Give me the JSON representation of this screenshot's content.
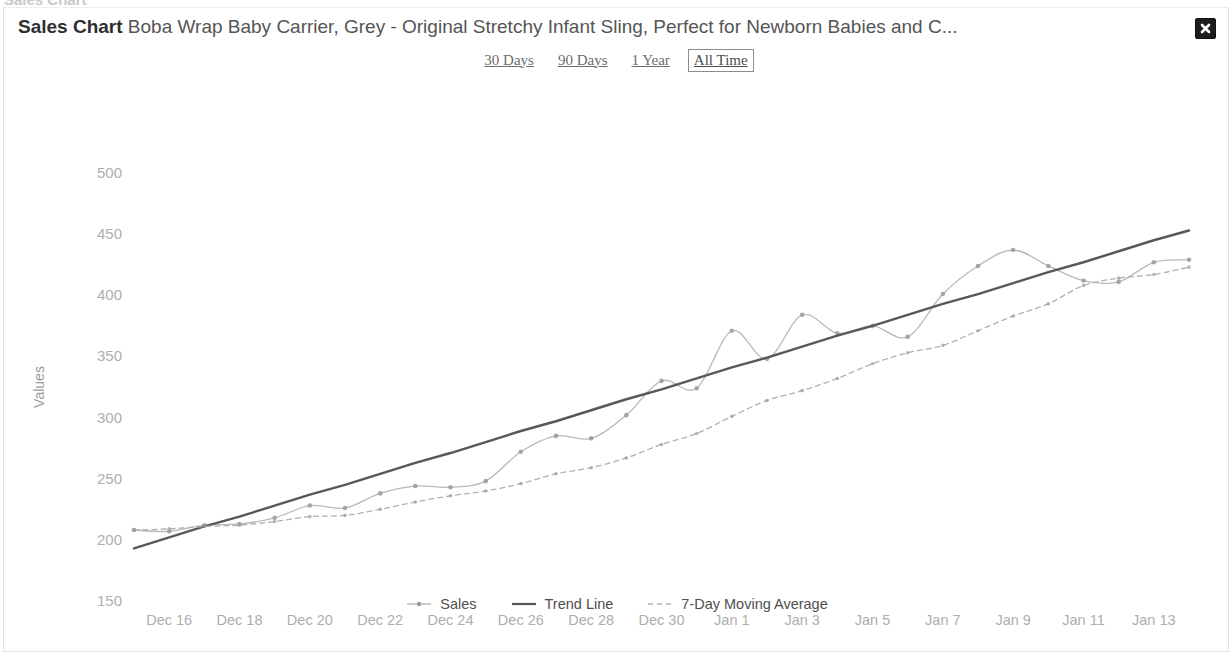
{
  "background_text": "Sales Chart",
  "header": {
    "title_strong": "Sales Chart",
    "title_rest": " Boba Wrap Baby Carrier, Grey - Original Stretchy Infant Sling, Perfect for Newborn Babies and C...",
    "close_label": "×"
  },
  "tabs": [
    {
      "label": "30 Days",
      "selected": false
    },
    {
      "label": "90 Days",
      "selected": false
    },
    {
      "label": "1 Year",
      "selected": false
    },
    {
      "label": "All Time",
      "selected": true
    }
  ],
  "colors": {
    "sales_line": "#b9b9b9",
    "sales_marker": "#9a9a9a",
    "trend_line": "#585858",
    "moving_average": "#b0b0b0",
    "axis_text": "#aeaeae",
    "axis_title": "#9b9b9b",
    "close_bg": "#1d1d1d"
  },
  "chart_data": {
    "type": "line",
    "title": "Sales Chart",
    "xlabel": "",
    "ylabel": "Values",
    "ylim": [
      150,
      500
    ],
    "yticks": [
      150,
      200,
      250,
      300,
      350,
      400,
      450,
      500
    ],
    "grid": false,
    "legend_position": "bottom",
    "x": [
      "Dec 15",
      "Dec 16",
      "Dec 17",
      "Dec 18",
      "Dec 19",
      "Dec 20",
      "Dec 21",
      "Dec 22",
      "Dec 23",
      "Dec 24",
      "Dec 25",
      "Dec 26",
      "Dec 27",
      "Dec 28",
      "Dec 29",
      "Dec 30",
      "Dec 31",
      "Jan 1",
      "Jan 2",
      "Jan 3",
      "Jan 4",
      "Jan 5",
      "Jan 6",
      "Jan 7",
      "Jan 8",
      "Jan 9",
      "Jan 10",
      "Jan 11",
      "Jan 12",
      "Jan 13",
      "Jan 14"
    ],
    "xticks": [
      "Dec 16",
      "Dec 18",
      "Dec 20",
      "Dec 22",
      "Dec 24",
      "Dec 26",
      "Dec 28",
      "Dec 30",
      "Jan 1",
      "Jan 3",
      "Jan 5",
      "Jan 7",
      "Jan 9",
      "Jan 11",
      "Jan 13"
    ],
    "xtick_indices": [
      1,
      3,
      5,
      7,
      9,
      11,
      13,
      15,
      17,
      19,
      21,
      23,
      25,
      27,
      29
    ],
    "series": [
      {
        "name": "Sales",
        "style": "line-markers",
        "values": [
          208,
          207,
          212,
          213,
          218,
          228,
          226,
          238,
          244,
          243,
          248,
          272,
          285,
          283,
          302,
          330,
          324,
          371,
          348,
          384,
          369,
          375,
          366,
          401,
          424,
          437,
          424,
          412,
          411,
          427,
          429
        ]
      },
      {
        "name": "Trend Line",
        "style": "solid",
        "values": [
          193,
          202,
          211,
          219,
          228,
          237,
          245,
          254,
          263,
          271,
          280,
          289,
          297,
          306,
          315,
          323,
          332,
          341,
          349,
          358,
          367,
          375,
          384,
          393,
          401,
          410,
          419,
          427,
          436,
          445,
          453
        ]
      },
      {
        "name": "7-Day Moving Average",
        "style": "dashed",
        "values": [
          208,
          209,
          211,
          212,
          215,
          219,
          220,
          225,
          231,
          236,
          240,
          246,
          254,
          259,
          267,
          278,
          287,
          301,
          314,
          322,
          332,
          344,
          353,
          359,
          371,
          383,
          393,
          408,
          414,
          417,
          423
        ]
      }
    ]
  }
}
